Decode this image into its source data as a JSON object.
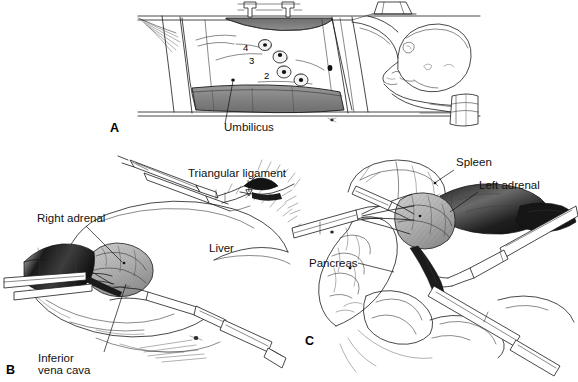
{
  "figure": {
    "kind": "medical-illustration",
    "background_color": "#ffffff",
    "ink_color": "#1a1a1a"
  },
  "panels": [
    {
      "id": "A",
      "letter": "A",
      "caption_labels": [
        "Umbilicus"
      ],
      "description": "Patient in lateral decubitus position on operating table with flexed table and trocar sites marked",
      "ports": [
        {
          "number": "4",
          "cx": 265,
          "cy": 45
        },
        {
          "number": "3",
          "cx": 280,
          "cy": 57
        },
        {
          "number": "2",
          "cx": 284,
          "cy": 72
        },
        {
          "number": "1",
          "cx": 299,
          "cy": 79
        }
      ],
      "port_number_positions": [
        {
          "label": "4",
          "x": 243,
          "y": 51
        },
        {
          "label": "3",
          "x": 249,
          "y": 64
        },
        {
          "label": "2",
          "x": 264,
          "y": 79
        }
      ],
      "labels": [
        {
          "text": "Umbilicus",
          "x": 224,
          "y": 131,
          "anchor": "start"
        }
      ],
      "letter_pos": {
        "x": 110,
        "y": 132
      }
    },
    {
      "id": "B",
      "letter": "B",
      "description": "Right adrenalectomy exposure: liver retracted, triangular ligament divided, right adrenal and inferior vena cava exposed",
      "labels": [
        {
          "text": "Triangular ligament",
          "x": 188,
          "y": 177,
          "anchor": "start"
        },
        {
          "text": "Right adrenal",
          "x": 37,
          "y": 222,
          "anchor": "start"
        },
        {
          "text": "Liver",
          "x": 209,
          "y": 252,
          "anchor": "start"
        },
        {
          "text": "Inferior",
          "x": 38,
          "y": 362,
          "anchor": "start"
        },
        {
          "text": "vena cava",
          "x": 38,
          "y": 374,
          "anchor": "start"
        }
      ],
      "letter_pos": {
        "x": 6,
        "y": 374
      }
    },
    {
      "id": "C",
      "letter": "C",
      "description": "Left adrenalectomy exposure: spleen mobilized, pancreatic tail reflected, left adrenal gland dissected",
      "labels": [
        {
          "text": "Spleen",
          "x": 456,
          "y": 166,
          "anchor": "start"
        },
        {
          "text": "Left adrenal",
          "x": 479,
          "y": 189,
          "anchor": "start"
        },
        {
          "text": "Pancreas",
          "x": 309,
          "y": 267,
          "anchor": "start"
        }
      ],
      "letter_pos": {
        "x": 305,
        "y": 345
      }
    }
  ],
  "palette": {
    "bolster_gray": "#8a8a8a",
    "organ_gray": "#bdbdbd",
    "dark_shadow": "#1c1c1c",
    "mid_gray": "#6f6f6f",
    "light_gray": "#dedede"
  }
}
